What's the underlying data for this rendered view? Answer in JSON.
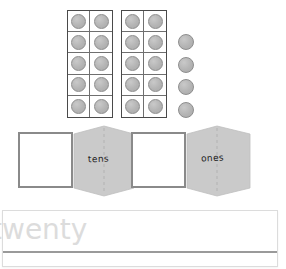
{
  "worksheet": {
    "title": "Place value ten frames worksheet",
    "manipulatives": {
      "type": "ten-frame counters",
      "counter_color": "#b4b4b4",
      "frames": [
        {
          "name": "ten-frame-1",
          "columns": 2,
          "rows": 5,
          "filled": 10,
          "capacity": 10
        },
        {
          "name": "ten-frame-2",
          "columns": 2,
          "rows": 5,
          "filled": 10,
          "capacity": 10
        }
      ],
      "loose_counters": 4,
      "total_counters": 24
    },
    "foldable": {
      "flap_color": "#c9c9c9",
      "fold_line_color": "#b0b0b0",
      "sections": [
        {
          "name": "tens-section",
          "label": "tens",
          "answer_value": ""
        },
        {
          "name": "ones-section",
          "label": "ones",
          "answer_value": ""
        }
      ]
    },
    "word_panel": {
      "number_word": "twenty",
      "word_color": "#dcdcdc",
      "rule_color": "#9a9a9a",
      "border_color": "#dcdcdc"
    }
  }
}
